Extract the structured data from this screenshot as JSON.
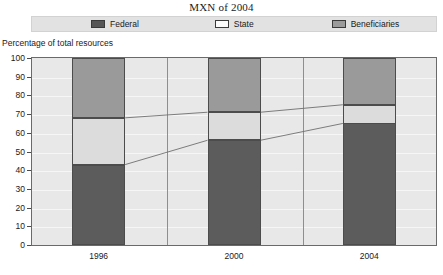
{
  "title": "MXN of 2004",
  "axis_title": "Percentage of total resources",
  "legend": {
    "items": [
      {
        "label": "Federal",
        "color": "#565656",
        "key": "federal"
      },
      {
        "label": "State",
        "color": "#fbfbfb",
        "key": "state"
      },
      {
        "label": "Beneficiaries",
        "color": "#9b9b9b",
        "key": "beneficiaries"
      }
    ]
  },
  "yticks": [
    "100",
    "90",
    "80",
    "70",
    "60",
    "50",
    "40",
    "30",
    "20",
    "10",
    "0"
  ],
  "xlabels": [
    "1996",
    "2000",
    "2004"
  ],
  "chart_data": {
    "type": "bar",
    "stacked": true,
    "title": "MXN of 2004",
    "xlabel": "",
    "ylabel": "Percentage of total resources",
    "ylim": [
      0,
      100
    ],
    "ytick_step": 10,
    "grid": true,
    "legend_position": "top",
    "categories": [
      "1996",
      "2000",
      "2004"
    ],
    "series": [
      {
        "name": "Federal",
        "color": "#5c5c5c",
        "values": [
          43,
          56,
          65
        ]
      },
      {
        "name": "State",
        "color": "#dcdcdc",
        "values": [
          25,
          15,
          10
        ]
      },
      {
        "name": "Beneficiaries",
        "color": "#9a9a9a",
        "values": [
          32,
          29,
          25
        ]
      }
    ],
    "cumulative_tops": {
      "federal": [
        43,
        56,
        65
      ],
      "state": [
        68,
        71,
        75
      ],
      "beneficiaries": [
        100,
        100,
        100
      ]
    },
    "connector_lines": [
      {
        "name": "federal-top",
        "points": [
          [
            0,
            43
          ],
          [
            1,
            56
          ],
          [
            2,
            65
          ]
        ]
      },
      {
        "name": "state-top",
        "points": [
          [
            0,
            68
          ],
          [
            1,
            71
          ],
          [
            2,
            75
          ]
        ]
      }
    ]
  }
}
